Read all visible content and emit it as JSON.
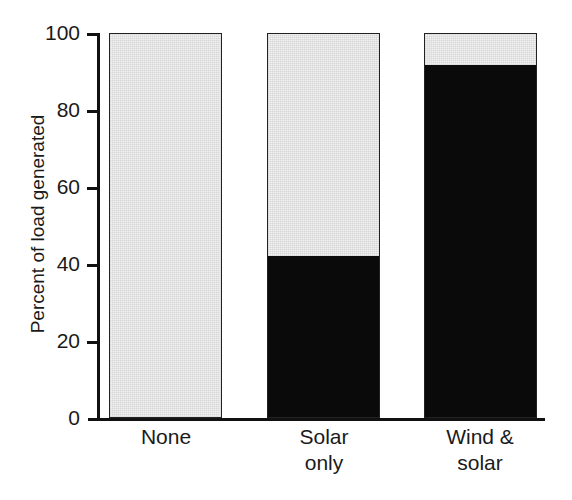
{
  "chart_data": {
    "type": "bar",
    "title": "",
    "subtitle": "",
    "xlabel": "",
    "ylabel": "Percent of load generated",
    "categories": [
      "None",
      "Solar only",
      "Wind & solar"
    ],
    "category_lines": [
      [
        "None"
      ],
      [
        "Solar",
        "only"
      ],
      [
        "Wind &",
        "solar"
      ]
    ],
    "stacked": true,
    "series": [
      {
        "name": "Renewable generation",
        "color": "#0a0a0a",
        "values": [
          0,
          42,
          92
        ]
      },
      {
        "name": "Conventional generation",
        "color": "#f0f0f0",
        "values": [
          100,
          58,
          8
        ]
      }
    ],
    "ylim": [
      0,
      100
    ],
    "yticks": [
      0,
      20,
      40,
      60,
      80,
      100
    ],
    "ytick_labels": [
      "0",
      "20",
      "40",
      "60",
      "80",
      "100"
    ],
    "grid": false,
    "legend": "none",
    "annotations": []
  },
  "axes": {
    "y_title": "Percent of load generated",
    "y_ticks": [
      "100",
      "80",
      "60",
      "40",
      "20",
      "0"
    ]
  }
}
